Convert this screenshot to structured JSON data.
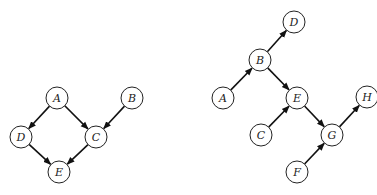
{
  "diagrams": [
    {
      "name": "left-graph",
      "node_radius": 11,
      "nodes": [
        {
          "id": "A",
          "label": "A",
          "x": 57,
          "y": 98
        },
        {
          "id": "B",
          "label": "B",
          "x": 132,
          "y": 98
        },
        {
          "id": "D",
          "label": "D",
          "x": 21,
          "y": 137
        },
        {
          "id": "C",
          "label": "C",
          "x": 96,
          "y": 137
        },
        {
          "id": "E",
          "label": "E",
          "x": 59,
          "y": 172
        }
      ],
      "edges": [
        {
          "from": "A",
          "to": "D"
        },
        {
          "from": "A",
          "to": "C"
        },
        {
          "from": "B",
          "to": "C"
        },
        {
          "from": "D",
          "to": "E"
        },
        {
          "from": "C",
          "to": "E"
        }
      ]
    },
    {
      "name": "right-graph",
      "node_radius": 11,
      "nodes": [
        {
          "id": "D",
          "label": "D",
          "x": 294,
          "y": 22
        },
        {
          "id": "B",
          "label": "B",
          "x": 260,
          "y": 60
        },
        {
          "id": "A",
          "label": "A",
          "x": 223,
          "y": 98
        },
        {
          "id": "E",
          "label": "E",
          "x": 297,
          "y": 98
        },
        {
          "id": "H",
          "label": "H",
          "x": 367,
          "y": 97
        },
        {
          "id": "C",
          "label": "C",
          "x": 261,
          "y": 135
        },
        {
          "id": "G",
          "label": "G",
          "x": 332,
          "y": 135
        },
        {
          "id": "F",
          "label": "F",
          "x": 297,
          "y": 172
        }
      ],
      "edges": [
        {
          "from": "A",
          "to": "B"
        },
        {
          "from": "B",
          "to": "D"
        },
        {
          "from": "B",
          "to": "E"
        },
        {
          "from": "C",
          "to": "E"
        },
        {
          "from": "E",
          "to": "G"
        },
        {
          "from": "F",
          "to": "G"
        },
        {
          "from": "G",
          "to": "H"
        }
      ]
    }
  ]
}
